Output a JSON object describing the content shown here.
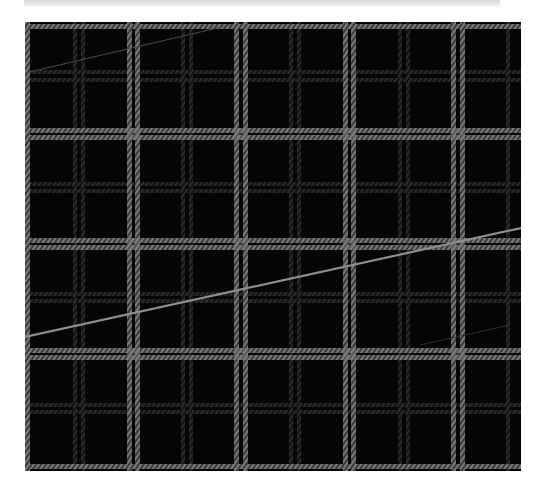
{
  "image": {
    "subject": "black tartan plaid fabric with gray twill stripes",
    "description": "Photograph of dark plaid cloth with double gray vertical and horizontal stripes and a loose diagonal thread",
    "colors": {
      "background": "#ffffff",
      "fabric_base": "#050505",
      "bright_stripe": "#6e6e6e",
      "dim_stripe": "#2c2c2c",
      "thread": "#8a8a8a",
      "top_strip": "#e4e4e4"
    },
    "pattern": {
      "period_px": 108,
      "vertical_bright_stripes_x": [
        27,
        129,
        137,
        236,
        245,
        345,
        353,
        453,
        462
      ],
      "vertical_dim_stripes_x": [
        75,
        83,
        183,
        191,
        291,
        299,
        400,
        408,
        508
      ],
      "horizontal_bright_stripes_y": [
        26,
        130,
        137,
        240,
        247,
        350,
        357,
        466
      ],
      "horizontal_dim_stripes_y": [
        72,
        80,
        184,
        191,
        294,
        301,
        405,
        412
      ]
    },
    "threads": [
      {
        "from": [
          25,
          337
        ],
        "to": [
          520,
          228
        ],
        "strength": "bright"
      },
      {
        "from": [
          25,
          73
        ],
        "to": [
          230,
          25
        ],
        "strength": "faint"
      },
      {
        "from": [
          420,
          345
        ],
        "to": [
          510,
          325
        ],
        "strength": "faint"
      }
    ]
  }
}
